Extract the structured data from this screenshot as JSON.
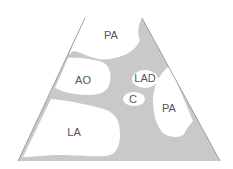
{
  "diagram": {
    "type": "echocardiographic-sector-schematic",
    "colors": {
      "tissue": "#c9c9c9",
      "chamber": "#ffffff",
      "outline": "#8a8a8a",
      "label": "#555555"
    },
    "labels": {
      "pa_top": "PA",
      "ao": "AO",
      "lad": "LAD",
      "c": "C",
      "pa_right": "PA",
      "la": "LA"
    }
  }
}
